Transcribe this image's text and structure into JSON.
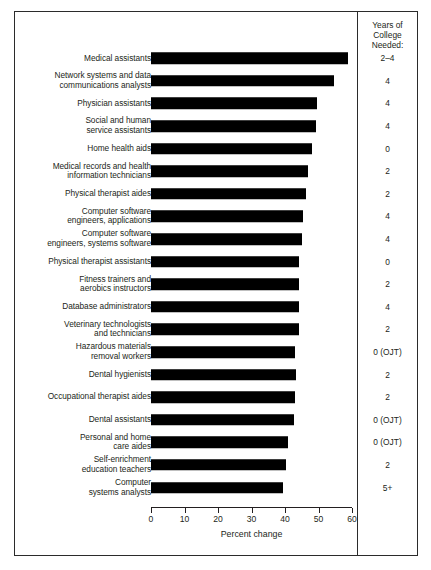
{
  "chart_data": {
    "type": "bar",
    "orientation": "horizontal",
    "title": "",
    "xlabel": "Percent change",
    "ylabel": "",
    "xlim": [
      0,
      60
    ],
    "xticks": [
      0,
      10,
      20,
      30,
      40,
      50,
      60
    ],
    "xtick_labels": [
      "0",
      "10",
      "20",
      "30",
      "40",
      "50",
      "60"
    ],
    "grid": false,
    "legend": "none",
    "categories": [
      "Medical assistants",
      "Network systems and data\ncommunications analysts",
      "Physician assistants",
      "Social and human\nservice assistants",
      "Home health aids",
      "Medical records and health\ninformation technicians",
      "Physical therapist aides",
      "Computer software\nengineers, applications",
      "Computer software\nengineers, systems software",
      "Physical therapist assistants",
      "Fitness trainers and\naerobics instructors",
      "Database administrators",
      "Veterinary technologists\nand technicians",
      "Hazardous materials\nremoval workers",
      "Dental hygienists",
      "Occupational therapist aides",
      "Dental assistants",
      "Personal and home\ncare aides",
      "Self-enrichment\neducation teachers",
      "Computer\nsystems analysts"
    ],
    "values": [
      58.9,
      54.6,
      49.6,
      49.2,
      48.1,
      46.8,
      46.3,
      45.5,
      45.2,
      44.2,
      44.1,
      44.2,
      44.1,
      43.1,
      43.3,
      43.0,
      42.7,
      41.0,
      40.3,
      39.4
    ],
    "annotations": {
      "secondary_column_header": "Years of\nCollege\nNeeded:",
      "secondary_column_values": [
        "2–4",
        "4",
        "4",
        "4",
        "0",
        "2",
        "2",
        "4",
        "4",
        "0",
        "2",
        "4",
        "2",
        "0 (OJT)",
        "2",
        "2",
        "0 (OJT)",
        "0 (OJT)",
        "2",
        "5+"
      ]
    },
    "bar_color": "#000000"
  }
}
